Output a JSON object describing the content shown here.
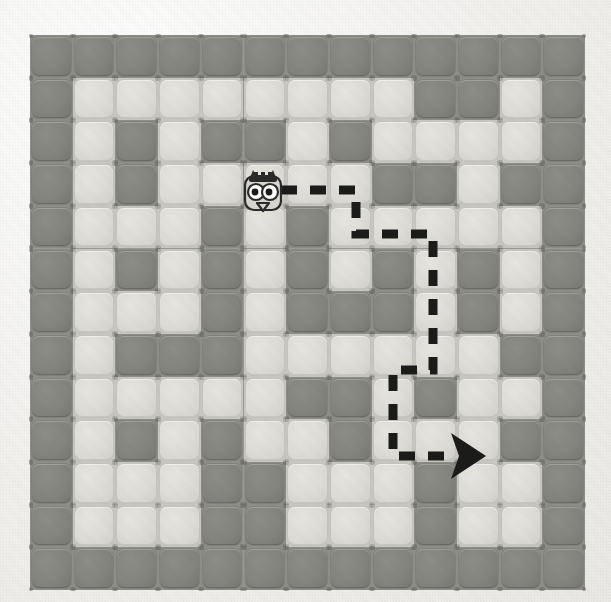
{
  "scene": {
    "title": "Grid Maze Puzzle",
    "description": "A 13x13 tiled maze board with an owl character and a dashed directional path ending in an arrow",
    "background_color": "#f2f1ee"
  },
  "board": {
    "rows": 13,
    "cols": 13,
    "x": 30,
    "y": 35,
    "tile_size": 42.7,
    "wall_color": "#85857f",
    "path_color": "#e0dfd9",
    "grout_color": "#9a9a95",
    "legend": {
      "0": "path-tile",
      "1": "wall-tile"
    },
    "cells": [
      [
        1,
        1,
        1,
        1,
        1,
        1,
        1,
        1,
        1,
        1,
        1,
        1,
        1
      ],
      [
        1,
        0,
        0,
        0,
        0,
        0,
        0,
        0,
        0,
        1,
        1,
        0,
        1
      ],
      [
        1,
        0,
        1,
        0,
        1,
        1,
        0,
        1,
        0,
        0,
        0,
        0,
        1
      ],
      [
        1,
        0,
        1,
        0,
        0,
        0,
        0,
        0,
        1,
        1,
        0,
        1,
        1
      ],
      [
        1,
        0,
        0,
        0,
        1,
        0,
        1,
        0,
        0,
        0,
        0,
        0,
        1
      ],
      [
        1,
        0,
        1,
        0,
        1,
        0,
        1,
        0,
        1,
        0,
        1,
        0,
        1
      ],
      [
        1,
        0,
        0,
        0,
        1,
        0,
        1,
        1,
        1,
        0,
        1,
        0,
        1
      ],
      [
        1,
        0,
        1,
        1,
        1,
        0,
        0,
        0,
        0,
        0,
        0,
        1,
        1
      ],
      [
        1,
        0,
        0,
        0,
        0,
        0,
        1,
        1,
        0,
        1,
        0,
        0,
        1
      ],
      [
        1,
        0,
        1,
        0,
        1,
        0,
        0,
        1,
        0,
        0,
        0,
        1,
        1
      ],
      [
        1,
        0,
        0,
        0,
        1,
        1,
        0,
        0,
        0,
        1,
        0,
        0,
        1
      ],
      [
        1,
        0,
        0,
        0,
        1,
        1,
        0,
        0,
        0,
        1,
        0,
        0,
        1
      ],
      [
        1,
        1,
        1,
        1,
        1,
        1,
        1,
        1,
        1,
        1,
        1,
        1,
        1
      ]
    ]
  },
  "character": {
    "name": "owl",
    "label": "owl-character",
    "grid_col": 5,
    "grid_row": 3,
    "x": 243,
    "y": 170,
    "width": 40,
    "height": 44,
    "body_color": "#d8d7d1",
    "outline_color": "#2b2b29",
    "eye_color": "#ffffff",
    "pupil_color": "#1a1a18"
  },
  "path_arrow": {
    "name": "dashed-route",
    "color": "#1b1b19",
    "stroke_width": 9,
    "dash_pattern": "16 13",
    "start_col": 5,
    "start_row": 3,
    "end_col": 11,
    "end_row": 10,
    "waypoints": [
      {
        "x": 281,
        "y": 190,
        "label": "start-at-owl"
      },
      {
        "x": 356,
        "y": 190,
        "label": "turn-down-1"
      },
      {
        "x": 356,
        "y": 234,
        "label": "turn-right-1"
      },
      {
        "x": 433,
        "y": 234,
        "label": "turn-down-2"
      },
      {
        "x": 433,
        "y": 370,
        "label": "turn-left-1"
      },
      {
        "x": 393,
        "y": 370,
        "label": "turn-down-3"
      },
      {
        "x": 393,
        "y": 456,
        "label": "turn-right-2"
      },
      {
        "x": 455,
        "y": 456,
        "label": "arrow-head"
      }
    ],
    "arrow_head": {
      "x": 455,
      "y": 456,
      "size": 23,
      "direction": "right"
    }
  }
}
